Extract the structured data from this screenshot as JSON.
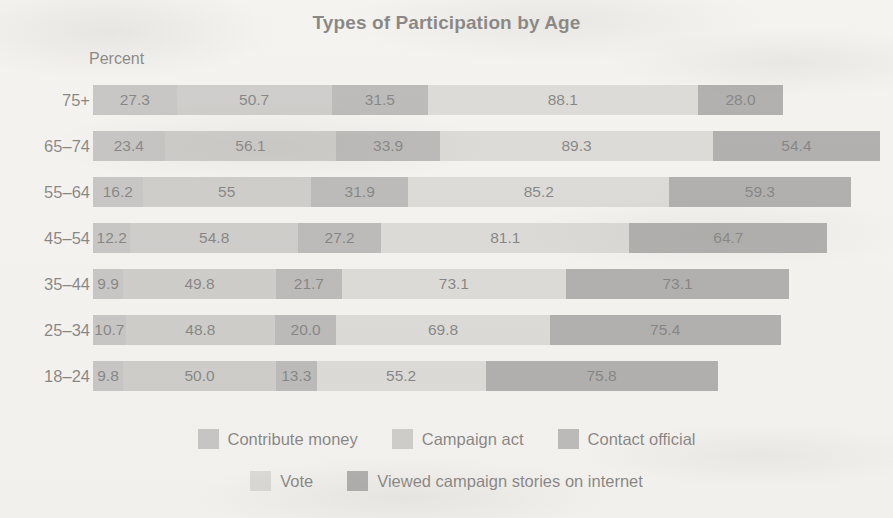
{
  "chart_data": {
    "type": "bar",
    "orientation": "horizontal",
    "stacked": true,
    "title": "Types of Participation by Age",
    "xlabel": "Percent",
    "ylabel": "",
    "axis_unit_label": "Percent",
    "grid": false,
    "legend_position": "bottom",
    "categories": [
      "75+",
      "65–74",
      "55–64",
      "45–54",
      "35–44",
      "25–34",
      "18–24"
    ],
    "series": [
      {
        "name": "Contribute money",
        "color": "#9a9a9a",
        "values": [
          27.3,
          23.4,
          16.2,
          12.2,
          9.9,
          10.7,
          9.8
        ],
        "labels": [
          "27.3",
          "23.4",
          "16.2",
          "12.2",
          "9.9",
          "10.7",
          "9.8"
        ]
      },
      {
        "name": "Campaign act",
        "color": "#a8a8a6",
        "values": [
          50.7,
          56.1,
          55.0,
          54.8,
          49.8,
          48.8,
          50.0
        ],
        "labels": [
          "50.7",
          "56.1",
          "55",
          "54.8",
          "49.8",
          "48.8",
          "50.0"
        ]
      },
      {
        "name": "Contact official",
        "color": "#848484",
        "values": [
          31.5,
          33.9,
          31.9,
          27.2,
          21.7,
          20.0,
          13.3
        ],
        "labels": [
          "31.5",
          "33.9",
          "31.9",
          "27.2",
          "21.7",
          "20.0",
          "13.3"
        ]
      },
      {
        "name": "Vote",
        "color": "#c3c3c0",
        "values": [
          88.1,
          89.3,
          85.2,
          81.1,
          73.1,
          69.8,
          55.2
        ],
        "labels": [
          "88.1",
          "89.3",
          "85.2",
          "81.1",
          "73.1",
          "69.8",
          "55.2"
        ]
      },
      {
        "name": "Viewed campaign stories on internet",
        "color": "#6e6e6e",
        "values": [
          28.0,
          54.4,
          59.3,
          64.7,
          73.1,
          75.4,
          75.8
        ],
        "labels": [
          "28.0",
          "54.4",
          "59.3",
          "64.7",
          "73.1",
          "75.4",
          "75.8"
        ]
      }
    ],
    "row_totals": [
      225.6,
      257.1,
      247.6,
      240.0,
      227.6,
      224.7,
      204.1
    ],
    "px_per_unit": 3.06,
    "bar_origin_px": 93
  },
  "legend": {
    "row1": [
      {
        "label": "Contribute money",
        "color": "#9a9a9a"
      },
      {
        "label": "Campaign act",
        "color": "#a8a8a6"
      },
      {
        "label": "Contact official",
        "color": "#848484"
      }
    ],
    "row2": [
      {
        "label": "Vote",
        "color": "#c3c3c0"
      },
      {
        "label": "Viewed campaign stories on internet",
        "color": "#6e6e6e"
      }
    ]
  }
}
